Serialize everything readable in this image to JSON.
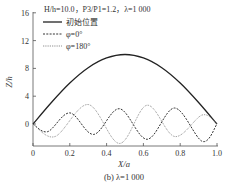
{
  "chart_data": {
    "type": "line",
    "title": "H/h=10.0，P3/P1=1.2，λ=1 000",
    "caption": "(b) λ=1 000",
    "xlabel": "X/a",
    "ylabel": "Z/h",
    "xlim": [
      0,
      1.0
    ],
    "ylim": [
      -3,
      16
    ],
    "x_ticks": [
      "0",
      "0.2",
      "0.4",
      "0.6",
      "0.8",
      "1.0"
    ],
    "y_ticks": [
      "0",
      "4",
      "8",
      "12",
      "16"
    ],
    "grid": false,
    "legend_position": "upper-left",
    "series": [
      {
        "name": "初始位置",
        "style": "solid",
        "x": [
          0,
          0.1,
          0.2,
          0.3,
          0.4,
          0.5,
          0.6,
          0.7,
          0.8,
          0.9,
          1.0
        ],
        "values": [
          0,
          3.1,
          5.9,
          8.1,
          9.5,
          10.0,
          9.5,
          8.1,
          5.9,
          3.1,
          0
        ]
      },
      {
        "name": "φ=0°",
        "style": "dashed",
        "x": [
          0,
          0.08,
          0.2,
          0.33,
          0.47,
          0.62,
          0.77,
          0.92,
          1.0
        ],
        "values": [
          0,
          -1.1,
          1.6,
          -1.5,
          2.2,
          -2.2,
          2.3,
          -2.5,
          0
        ]
      },
      {
        "name": "φ=180°",
        "style": "dotted",
        "x": [
          0,
          0.12,
          0.3,
          0.47,
          0.62,
          0.77,
          0.92,
          1.0
        ],
        "values": [
          0,
          -1.8,
          2.8,
          -2.8,
          2.7,
          -1.8,
          1.3,
          0
        ]
      }
    ]
  },
  "legend": {
    "title": "H/h=10.0，P3/P1=1.2，λ=1 000",
    "items": [
      "初始位置",
      "φ=0°",
      "φ=180°"
    ]
  }
}
